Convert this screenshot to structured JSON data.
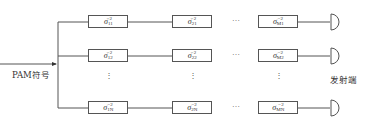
{
  "diagram": {
    "input_label": "PAM符号",
    "output_label": "发射端",
    "rows": [
      {
        "id": "row-1",
        "boxes": [
          {
            "symbol": "σ",
            "subscript": "11",
            "superscript": "−2"
          },
          {
            "symbol": "σ",
            "subscript": "21",
            "superscript": "−2"
          },
          {
            "symbol": "σ",
            "subscript": "M1",
            "superscript": "−2"
          }
        ]
      },
      {
        "id": "row-2",
        "boxes": [
          {
            "symbol": "σ",
            "subscript": "12",
            "superscript": "−2"
          },
          {
            "symbol": "σ",
            "subscript": "22",
            "superscript": "−2"
          },
          {
            "symbol": "σ",
            "subscript": "M2",
            "superscript": "−2"
          }
        ]
      },
      {
        "id": "row-n",
        "boxes": [
          {
            "symbol": "σ",
            "subscript": "1N",
            "superscript": "−2"
          },
          {
            "symbol": "σ",
            "subscript": "2N",
            "superscript": "−2"
          },
          {
            "symbol": "σ",
            "subscript": "MN",
            "superscript": "−2"
          }
        ]
      }
    ],
    "horizontal_ellipsis": "…",
    "vertical_ellipsis": "⋮",
    "colors": {
      "line": "#555555",
      "text": "#333333",
      "background": "#ffffff"
    }
  }
}
